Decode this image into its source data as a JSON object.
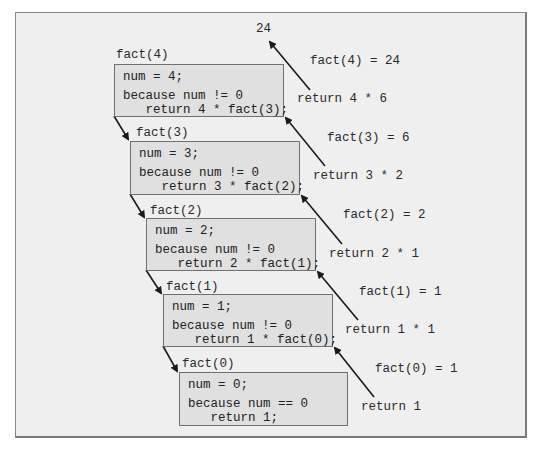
{
  "diagram": {
    "result_value": "24",
    "frames": [
      {
        "label": "fact(4)",
        "assign": "num = 4;",
        "condition": "because num != 0",
        "action": "   return 4 * fact(3);"
      },
      {
        "label": "fact(3)",
        "assign": "num = 3;",
        "condition": "because num != 0",
        "action": "   return 3 * fact(2);"
      },
      {
        "label": "fact(2)",
        "assign": "num = 2;",
        "condition": "because num != 0",
        "action": "   return 2 * fact(1);"
      },
      {
        "label": "fact(1)",
        "assign": "num = 1;",
        "condition": "because num != 0",
        "action": "   return 1 * fact(0);"
      },
      {
        "label": "fact(0)",
        "assign": "num = 0;",
        "condition": "because num == 0",
        "action": "   return 1;"
      }
    ],
    "returns": [
      {
        "result": "fact(4) = 24",
        "expr": "return 4 * 6"
      },
      {
        "result": "fact(3) = 6",
        "expr": "return 3 * 2"
      },
      {
        "result": "fact(2) = 2",
        "expr": "return 2 * 1"
      },
      {
        "result": "fact(1) = 1",
        "expr": "return 1 * 1"
      },
      {
        "result": "fact(0) = 1",
        "expr": "return 1"
      }
    ],
    "colors": {
      "frame_bg": "#efefef",
      "box_bg": "#e0e0e0",
      "box_border": "#707070",
      "arrow": "#1a1a1a"
    }
  }
}
